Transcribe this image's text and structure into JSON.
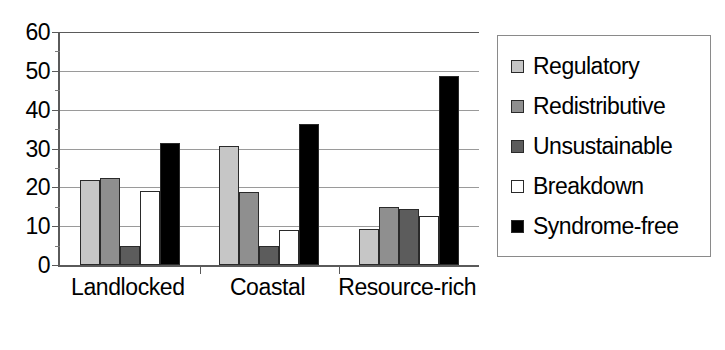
{
  "chart_data": {
    "type": "bar",
    "title": "",
    "xlabel": "",
    "ylabel": "",
    "categories": [
      "Landlocked",
      "Coastal",
      "Resource-rich"
    ],
    "series": [
      {
        "name": "Regulatory",
        "color": "#c6c6c6",
        "values": [
          21.9,
          30.6,
          9.4
        ]
      },
      {
        "name": "Redistributive",
        "color": "#8f8f8f",
        "values": [
          22.4,
          18.8,
          15.0
        ]
      },
      {
        "name": "Unsustainable",
        "color": "#5c5c5c",
        "values": [
          5.0,
          5.0,
          14.3
        ]
      },
      {
        "name": "Breakdown",
        "color": "#ffffff",
        "values": [
          19.0,
          9.0,
          12.7
        ]
      },
      {
        "name": "Syndrome-free",
        "color": "#000000",
        "values": [
          31.5,
          36.4,
          48.7
        ]
      }
    ],
    "ylim": [
      0,
      60
    ],
    "yticks": [
      0,
      10,
      20,
      30,
      40,
      50,
      60
    ],
    "ytick_labels": [
      "0",
      "10",
      "20",
      "30",
      "40",
      "50",
      "60"
    ],
    "grid": true,
    "grid_axis": "y",
    "legend_position": "right",
    "legend_entries": [
      "Regulatory",
      "Redistributive",
      "Unsustainable",
      "Breakdown",
      "Syndrome-free"
    ]
  }
}
